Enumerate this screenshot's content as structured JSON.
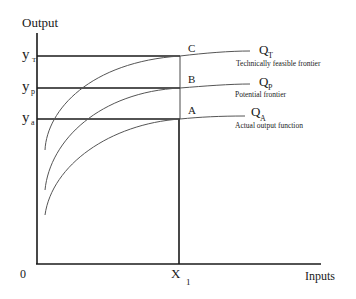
{
  "axes": {
    "y_label": "Output",
    "x_label": "Inputs",
    "origin": "0",
    "x_tick": {
      "main": "X",
      "sub": "1"
    }
  },
  "y_levels": [
    {
      "main": "y",
      "sub": "T"
    },
    {
      "main": "y",
      "sub": "p"
    },
    {
      "main": "y",
      "sub": "a"
    }
  ],
  "points": {
    "c": "C",
    "b": "B",
    "a": "A"
  },
  "curves": [
    {
      "main": "Q",
      "sub": "T",
      "description": "Technically feasible frontier"
    },
    {
      "main": "Q",
      "sub": "P",
      "description": "Potential frontier"
    },
    {
      "main": "Q",
      "sub": "A",
      "description": "Actual output function"
    }
  ],
  "colors": {
    "axis": "#1a1a1a",
    "curve": "#555555"
  }
}
